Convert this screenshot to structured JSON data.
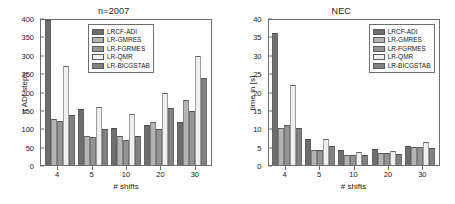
{
  "figure": {
    "width": 455,
    "height": 204,
    "background": "#ffffff"
  },
  "series_colors": [
    "#6e6e6e",
    "#b4b4b4",
    "#949494",
    "#efefef",
    "#828282"
  ],
  "legend": {
    "position": "top-right",
    "entries": [
      {
        "label": "LRCF-ADI",
        "color": "#6e6e6e"
      },
      {
        "label": "LR-GMRES",
        "color": "#b4b4b4"
      },
      {
        "label": "LR-FGRMES",
        "color": "#949494"
      },
      {
        "label": "LR-QMR",
        "color": "#efefef"
      },
      {
        "label": "LR-BICGSTAB",
        "color": "#828282"
      }
    ]
  },
  "chart_data": [
    {
      "type": "bar",
      "title": "n=2007",
      "xlabel": "# shifts",
      "ylabel": "# ADI steps",
      "categories": [
        "4",
        "5",
        "10",
        "20",
        "30"
      ],
      "ylim": [
        0,
        400
      ],
      "yticks": [
        0,
        50,
        100,
        150,
        200,
        250,
        300,
        350,
        400
      ],
      "grid": false,
      "legend_position": "upper-center",
      "series": [
        {
          "name": "LRCF-ADI",
          "color": "#6e6e6e",
          "values": [
            395,
            152,
            101,
            109,
            117
          ]
        },
        {
          "name": "LR-GMRES",
          "color": "#b4b4b4",
          "values": [
            125,
            79,
            79,
            118,
            177
          ]
        },
        {
          "name": "LR-FGRMES",
          "color": "#949494",
          "values": [
            120,
            75,
            68,
            97,
            148
          ]
        },
        {
          "name": "LR-QMR",
          "color": "#efefef",
          "values": [
            270,
            158,
            139,
            196,
            296
          ]
        },
        {
          "name": "LR-BICGSTAB",
          "color": "#828282",
          "values": [
            137,
            99,
            78,
            156,
            236
          ]
        }
      ]
    },
    {
      "type": "bar",
      "title": "NEC",
      "xlabel": "# shifts",
      "ylabel": "time in [s]",
      "categories": [
        "4",
        "5",
        "10",
        "20",
        "30"
      ],
      "ylim": [
        0,
        40
      ],
      "yticks": [
        0,
        5,
        10,
        15,
        20,
        25,
        30,
        35,
        40
      ],
      "grid": false,
      "legend_position": "upper-right",
      "series": [
        {
          "name": "LRCF-ADI",
          "color": "#6e6e6e",
          "values": [
            36.0,
            7.0,
            4.2,
            4.3,
            5.3
          ]
        },
        {
          "name": "LR-GMRES",
          "color": "#b4b4b4",
          "values": [
            10.0,
            4.1,
            2.8,
            3.3,
            5.0
          ]
        },
        {
          "name": "LR-FGRMES",
          "color": "#949494",
          "values": [
            11.0,
            4.1,
            2.7,
            3.2,
            5.0
          ]
        },
        {
          "name": "LR-QMR",
          "color": "#efefef",
          "values": [
            21.9,
            7.0,
            3.5,
            3.9,
            6.3
          ]
        },
        {
          "name": "LR-BICGSTAB",
          "color": "#828282",
          "values": [
            10.0,
            5.2,
            2.8,
            3.1,
            4.6
          ]
        }
      ]
    }
  ]
}
